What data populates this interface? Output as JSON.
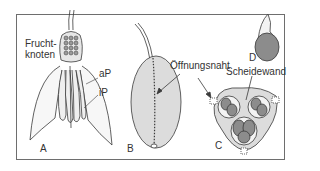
{
  "figure": {
    "panels": [
      {
        "id": "A",
        "label": "A"
      },
      {
        "id": "B",
        "label": "B"
      },
      {
        "id": "C",
        "label": "C"
      },
      {
        "id": "D",
        "label": "D"
      }
    ],
    "annotations": {
      "fruchtknoten_line1": "Frucht-",
      "fruchtknoten_line2": "knoten",
      "aP": "aP",
      "iP": "iP",
      "oeffnungsnaht": "Öffnungsnaht",
      "scheidewand": "Scheidewand"
    },
    "colors": {
      "fill_light": "#d9d9d9",
      "fill_dark": "#8c8c8c",
      "stroke": "#3a3a3a"
    }
  }
}
